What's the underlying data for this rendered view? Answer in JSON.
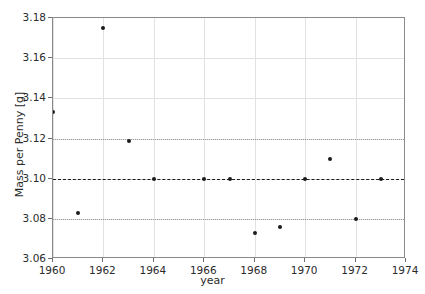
{
  "chart_data": {
    "type": "scatter",
    "title": "",
    "xlabel": "year",
    "ylabel": "Mass per Penny [g]",
    "xlim": [
      1960,
      1974
    ],
    "ylim": [
      3.06,
      3.18
    ],
    "xticks": [
      1960,
      1962,
      1964,
      1966,
      1968,
      1970,
      1972,
      1974
    ],
    "xticklabels": [
      "1960",
      "1962",
      "1964",
      "1966",
      "1968",
      "1970",
      "1972",
      "1974"
    ],
    "yticks": [
      3.06,
      3.08,
      3.1,
      3.12,
      3.14,
      3.16,
      3.18
    ],
    "yticklabels": [
      "3.06",
      "3.08",
      "3.10",
      "3.12",
      "3.14",
      "3.16",
      "3.18"
    ],
    "grid": true,
    "legend": "none",
    "marker_color": "#1b1b1b",
    "grid_color": "#e2e2e2",
    "x": [
      1960,
      1961,
      1962,
      1963,
      1964,
      1965,
      1966,
      1967,
      1968,
      1969,
      1970,
      1971,
      1972,
      1973,
      1974
    ],
    "values": [
      3.133,
      3.083,
      3.175,
      3.119,
      3.1,
      3.06,
      3.1,
      3.1,
      3.073,
      3.076,
      3.1,
      3.11,
      3.08,
      3.1,
      3.093
    ],
    "points": [
      {
        "year": 1960,
        "mass": 3.133
      },
      {
        "year": 1961,
        "mass": 3.083
      },
      {
        "year": 1962,
        "mass": 3.175
      },
      {
        "year": 1963,
        "mass": 3.119
      },
      {
        "year": 1964,
        "mass": 3.1
      },
      {
        "year": 1965,
        "mass": 3.06
      },
      {
        "year": 1966,
        "mass": 3.1
      },
      {
        "year": 1967,
        "mass": 3.1
      },
      {
        "year": 1968,
        "mass": 3.073
      },
      {
        "year": 1969,
        "mass": 3.076
      },
      {
        "year": 1970,
        "mass": 3.1
      },
      {
        "year": 1971,
        "mass": 3.11
      },
      {
        "year": 1972,
        "mass": 3.08
      },
      {
        "year": 1973,
        "mass": 3.1
      },
      {
        "year": 1974,
        "mass": 3.093
      }
    ],
    "reference_lines": [
      {
        "name": "nominal-mass",
        "value": 3.1,
        "style": "dashed",
        "color": "#1a1a1a"
      },
      {
        "name": "upper-tolerance",
        "value": 3.12,
        "style": "dotted",
        "color": "#9a9a9a"
      },
      {
        "name": "lower-tolerance",
        "value": 3.08,
        "style": "dotted",
        "color": "#9a9a9a"
      }
    ]
  }
}
